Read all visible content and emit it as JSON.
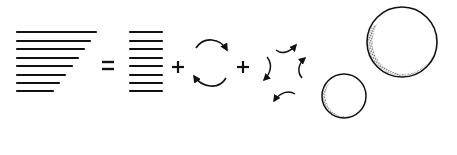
{
  "diagram": {
    "colors": {
      "ink": "#111111",
      "background": "#ffffff",
      "stipple": "#555555"
    },
    "operators": {
      "equals": "=",
      "plus": "+"
    },
    "shear_profile": {
      "x_left": 17,
      "rows_y": [
        32,
        41,
        49,
        58,
        66,
        75,
        83,
        91
      ],
      "rows_x_right": [
        96,
        90,
        84,
        78,
        72,
        65,
        59,
        53
      ]
    },
    "uniform_profile": {
      "x_left": 130,
      "x_right": 162,
      "rows_y": [
        32,
        41,
        49,
        58,
        66,
        75,
        83,
        91
      ]
    },
    "rotation_icon": "rotation-arrows",
    "strain_icon": "strain-arrows",
    "bubbles": [
      {
        "name": "large-bubble",
        "cx": 402,
        "cy": 42,
        "r": 35
      },
      {
        "name": "small-bubble",
        "cx": 344,
        "cy": 96,
        "r": 22
      }
    ]
  }
}
